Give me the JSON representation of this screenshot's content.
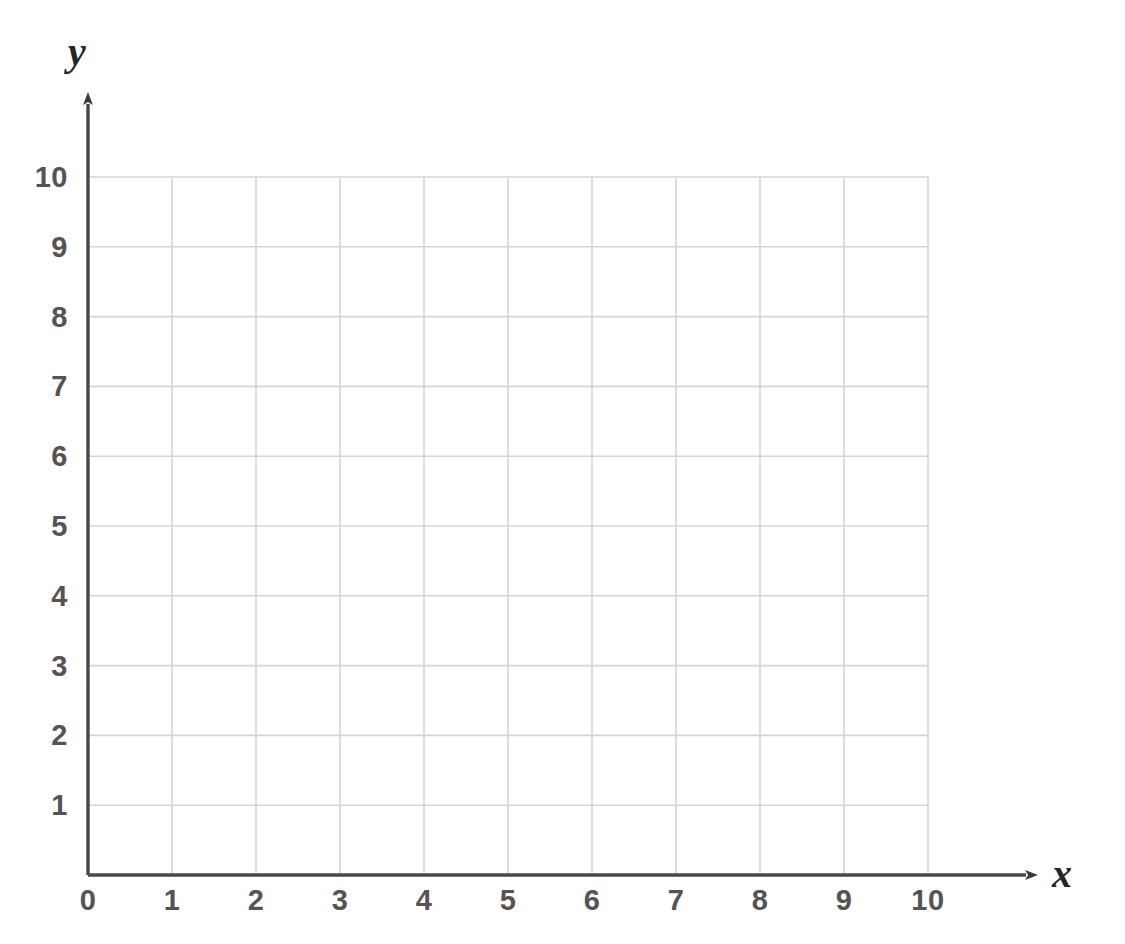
{
  "figure": {
    "kind": "blank-coordinate-grid",
    "background_color": "#ffffff",
    "axis_color": "#4a484a",
    "gridline_color": "#d6d4d6",
    "label_color": "#555355",
    "axis_name_color": "#262526"
  },
  "axes": {
    "x": {
      "name": "x",
      "min": 0,
      "max": 10,
      "step": 1,
      "arrow": true,
      "tick_labels": [
        "0",
        "1",
        "2",
        "3",
        "4",
        "5",
        "6",
        "7",
        "8",
        "9",
        "10"
      ]
    },
    "y": {
      "name": "y",
      "min": 0,
      "max": 10,
      "step": 1,
      "arrow": true,
      "tick_labels": [
        "0",
        "1",
        "2",
        "3",
        "4",
        "5",
        "6",
        "7",
        "8",
        "9",
        "10"
      ]
    }
  },
  "chart_data": {
    "type": "scatter",
    "title": "",
    "subtitle": "",
    "xlabel": "x",
    "ylabel": "y",
    "xlim": [
      0,
      10
    ],
    "ylim": [
      0,
      10
    ],
    "xticks": [
      0,
      1,
      2,
      3,
      4,
      5,
      6,
      7,
      8,
      9,
      10
    ],
    "yticks": [
      0,
      1,
      2,
      3,
      4,
      5,
      6,
      7,
      8,
      9,
      10
    ],
    "xtick_labels": [
      "0",
      "1",
      "2",
      "3",
      "4",
      "5",
      "6",
      "7",
      "8",
      "9",
      "10"
    ],
    "ytick_labels": [
      "0",
      "1",
      "2",
      "3",
      "4",
      "5",
      "6",
      "7",
      "8",
      "9",
      "10"
    ],
    "grid": true,
    "legend": null,
    "annotations": [],
    "series": [],
    "x": [],
    "values": [],
    "note": "Empty graph paper: no data points, curves, bars or markers are plotted."
  }
}
